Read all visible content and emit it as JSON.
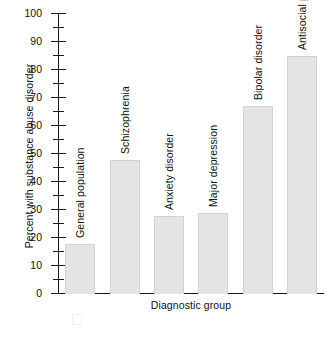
{
  "chart_data": {
    "type": "bar",
    "title": "",
    "xlabel": "Diagnostic group",
    "ylabel": "Percent with substance abuse disorder",
    "categories": [
      "General population",
      "Schizophrenia",
      "Anxiety disorder",
      "Major depression",
      "Bipolar disorder",
      "Antisocial personality disorder"
    ],
    "values": [
      18,
      48,
      28,
      29,
      67,
      85
    ],
    "ylim": [
      0,
      100
    ],
    "ytick_labels": [
      "0",
      "10",
      "20",
      "30",
      "40",
      "50",
      "60",
      "70",
      "80",
      "90",
      "100"
    ],
    "ytick_values": [
      0,
      10,
      20,
      30,
      40,
      50,
      60,
      70,
      80,
      90,
      100
    ],
    "minor_tick_values": [
      5,
      15,
      25,
      35,
      45,
      55,
      65,
      75,
      85,
      95
    ],
    "grid": false,
    "legend": false,
    "legend_position": "none",
    "bar_color": "#e4e4e4",
    "bar_edge_color": "#d2d2d2",
    "axis_color": "#1a1a1a",
    "bar_label_rotation": "vertical"
  }
}
